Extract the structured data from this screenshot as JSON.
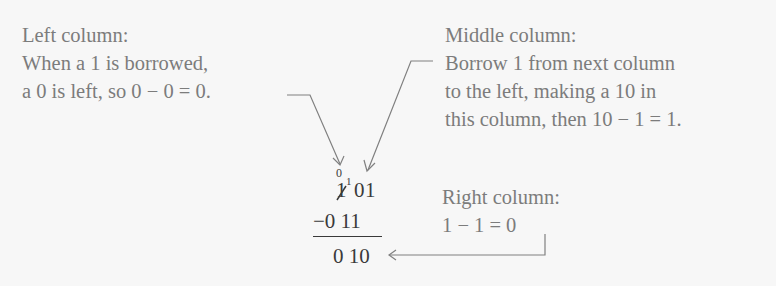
{
  "left_note": {
    "title": "Left column:",
    "lines": [
      "When a 1 is borrowed,",
      "a 0 is left, so 0 − 0 = 0."
    ]
  },
  "middle_note": {
    "title": "Middle column:",
    "lines": [
      "Borrow 1 from next column",
      "to the left, making a 10 in",
      "this column, then 10 − 1 = 1."
    ]
  },
  "right_note": {
    "title": "Right column:",
    "lines": [
      "1 − 1 = 0"
    ]
  },
  "calculation": {
    "borrow_marks": {
      "left_column_new": "0",
      "middle_column_borrow": "1"
    },
    "minuend": {
      "left_struck": "1",
      "middle": "0",
      "right": "1"
    },
    "subtrahend": "−0 11",
    "result": "0 10"
  },
  "colors": {
    "note_text": "#7c7c7c",
    "calc_text": "#3a3a3a",
    "arrow": "#808080",
    "background": "#f7f7f7"
  }
}
